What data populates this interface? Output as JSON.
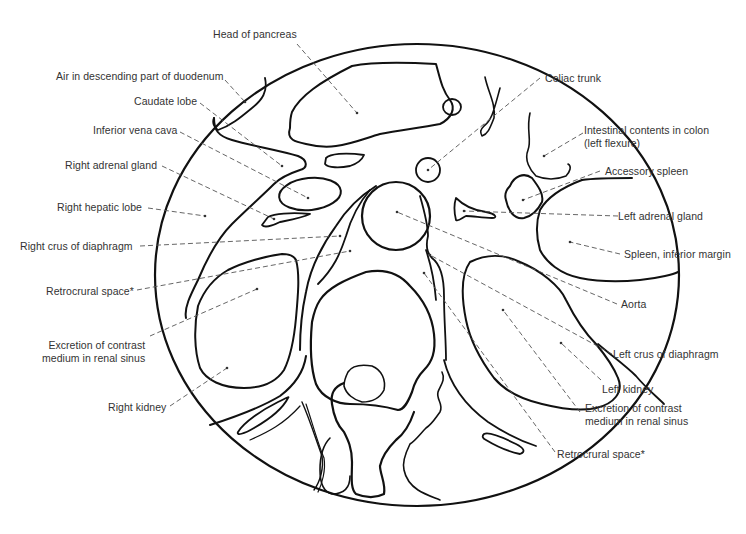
{
  "figure": {
    "type": "annotated anatomical line drawing (axial CT section, upper abdomen)",
    "colors": {
      "outline": "#111111",
      "leader": "#555555",
      "text": "#333333",
      "background": "#ffffff"
    }
  },
  "labels": {
    "head_of_pancreas": "Head of pancreas",
    "air_duodenum": "Air in descending part of duodenum",
    "caudate_lobe": "Caudate lobe",
    "inferior_vena_cava": "Inferior vena cava",
    "right_adrenal_gland": "Right adrenal gland",
    "right_hepatic_lobe": "Right hepatic lobe",
    "right_crus": "Right crus of diaphragm",
    "retrocrural_space_left": "Retrocrural space*",
    "excretion_right_line1": "Excretion of contrast",
    "excretion_right_line2": "medium in renal sinus",
    "right_kidney": "Right kidney",
    "celiac_trunk": "Celiac trunk",
    "intestinal_line1": "Intestinal contents in colon",
    "intestinal_line2": "(left flexure)",
    "accessory_spleen": "Accessory spleen",
    "left_adrenal_gland": "Left adrenal gland",
    "spleen_inferior_margin": "Spleen, inferior margin",
    "aorta": "Aorta",
    "left_crus": "Left crus of diaphragm",
    "left_kidney": "Left kidney",
    "excretion_left_line1": "Excretion of contrast",
    "excretion_left_line2": "medium in renal sinus",
    "retrocrural_space_right": "Retrocrural space*"
  }
}
